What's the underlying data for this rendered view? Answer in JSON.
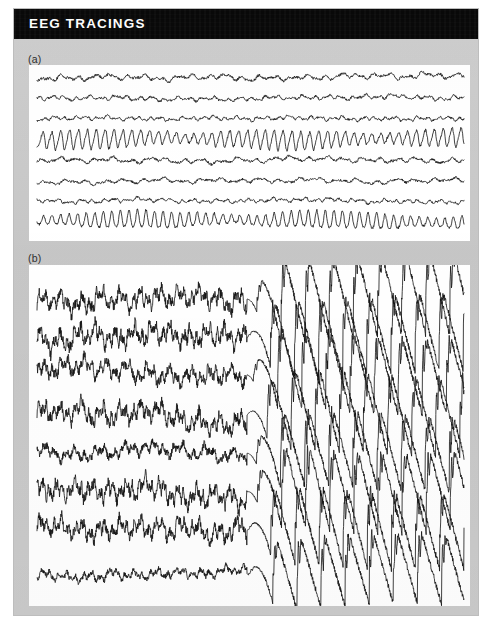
{
  "header": {
    "title": "EEG TRACINGS",
    "background_color": "#090909",
    "text_color": "#ffffff"
  },
  "page": {
    "background_color": "#c9c9c9",
    "panel_background_color": "#ffffff",
    "trace_color": "#111111"
  },
  "panels": [
    {
      "id": "a",
      "label": "(a)",
      "caption_implied": "Normal interictal background EEG",
      "channel_count": 8,
      "seizure_onset": null
    },
    {
      "id": "b",
      "label": "(b)",
      "caption_implied": "EEG showing onset of seizure activity",
      "channel_count": 8,
      "seizure_onset": "Start of seizure activity"
    }
  ],
  "annotation": {
    "text": "Start of seizure activity",
    "arrow_glyph": "↑",
    "arrow_icon_name": "up-arrow-icon"
  },
  "chart_data": {
    "type": "line",
    "title": "EEG TRACINGS",
    "xlabel": "",
    "ylabel": "",
    "grid": false,
    "legend_position": "none",
    "annotations": [
      {
        "panel": "b",
        "text": "Start of seizure activity",
        "x_fraction": 0.492,
        "marker": "up-arrow"
      }
    ],
    "panels": [
      {
        "id": "a",
        "label": "(a)",
        "x_range": [
          0,
          1
        ],
        "y_range": [
          0,
          1
        ],
        "series": [
          {
            "name": "channel-1",
            "baseline": 0.072,
            "pattern": "low-amplitude-mixed",
            "amplitude": 0.016,
            "frequency": 26,
            "seed": 11
          },
          {
            "name": "channel-2",
            "baseline": 0.19,
            "pattern": "low-amplitude-beta",
            "amplitude": 0.013,
            "frequency": 34,
            "seed": 23
          },
          {
            "name": "channel-3",
            "baseline": 0.305,
            "pattern": "low-amplitude-beta",
            "amplitude": 0.012,
            "frequency": 40,
            "seed": 37
          },
          {
            "name": "channel-4",
            "baseline": 0.42,
            "pattern": "rhythmic-alpha-high",
            "amplitude": 0.052,
            "frequency": 48,
            "seed": 51
          },
          {
            "name": "channel-5",
            "baseline": 0.54,
            "pattern": "low-amplitude-mixed",
            "amplitude": 0.015,
            "frequency": 24,
            "seed": 67
          },
          {
            "name": "channel-6",
            "baseline": 0.655,
            "pattern": "low-amplitude-mixed",
            "amplitude": 0.014,
            "frequency": 22,
            "seed": 83
          },
          {
            "name": "channel-7",
            "baseline": 0.772,
            "pattern": "low-amplitude-beta",
            "amplitude": 0.012,
            "frequency": 38,
            "seed": 97
          },
          {
            "name": "channel-8",
            "baseline": 0.89,
            "pattern": "rhythmic-alpha-high",
            "amplitude": 0.048,
            "frequency": 50,
            "seed": 113
          }
        ]
      },
      {
        "id": "b",
        "label": "(b)",
        "x_range": [
          0,
          1
        ],
        "y_range": [
          0,
          1
        ],
        "onset_x_fraction": 0.492,
        "series": [
          {
            "name": "channel-1",
            "baseline": 0.1,
            "pre_amplitude": 0.028,
            "pre_frequency": 30,
            "ictal_amplitude": 0.115,
            "ictal_frequency": 9,
            "seed": 7
          },
          {
            "name": "channel-2",
            "baseline": 0.212,
            "pre_amplitude": 0.03,
            "pre_frequency": 32,
            "ictal_amplitude": 0.11,
            "ictal_frequency": 9,
            "seed": 19
          },
          {
            "name": "channel-3",
            "baseline": 0.322,
            "pre_amplitude": 0.026,
            "pre_frequency": 28,
            "ictal_amplitude": 0.108,
            "ictal_frequency": 9,
            "seed": 29
          },
          {
            "name": "channel-4",
            "baseline": 0.44,
            "pre_amplitude": 0.029,
            "pre_frequency": 30,
            "ictal_amplitude": 0.112,
            "ictal_frequency": 9,
            "seed": 41
          },
          {
            "name": "channel-5",
            "baseline": 0.552,
            "pre_amplitude": 0.02,
            "pre_frequency": 22,
            "ictal_amplitude": 0.105,
            "ictal_frequency": 9,
            "seed": 53
          },
          {
            "name": "channel-6",
            "baseline": 0.665,
            "pre_amplitude": 0.03,
            "pre_frequency": 34,
            "ictal_amplitude": 0.11,
            "ictal_frequency": 9,
            "seed": 61
          },
          {
            "name": "channel-7",
            "baseline": 0.778,
            "pre_amplitude": 0.028,
            "pre_frequency": 30,
            "ictal_amplitude": 0.106,
            "ictal_frequency": 9,
            "seed": 73
          },
          {
            "name": "channel-8",
            "baseline": 0.905,
            "pre_amplitude": 0.014,
            "pre_frequency": 26,
            "ictal_amplitude": 0.098,
            "ictal_frequency": 9,
            "seed": 89
          }
        ]
      }
    ]
  }
}
